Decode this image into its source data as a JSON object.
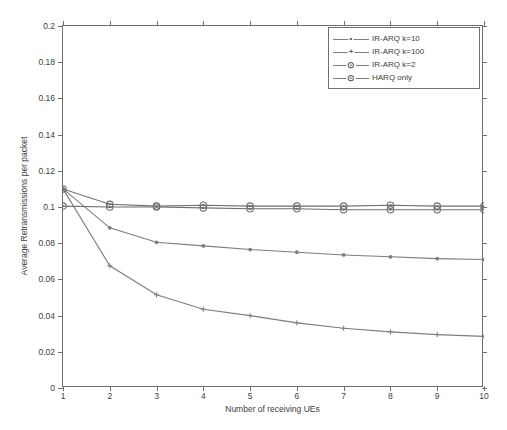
{
  "axes": {
    "xlabel": "Number of receiving UEs",
    "ylabel": "Average Retransmissions per packet",
    "xticks": [
      "1",
      "2",
      "3",
      "4",
      "5",
      "6",
      "7",
      "8",
      "9",
      "10"
    ],
    "yticks": [
      "0",
      "0.02",
      "0.04",
      "0.06",
      "0.08",
      "0.1",
      "0.12",
      "0.14",
      "0.16",
      "0.18",
      "0.2"
    ]
  },
  "legend": {
    "items": [
      {
        "label": "IR-ARQ k=10",
        "marker": "dot-marker"
      },
      {
        "label": "IR-ARQ k=100",
        "marker": "plus-marker"
      },
      {
        "label": "IR-ARQ k=2",
        "marker": "circle-marker"
      },
      {
        "label": "HARQ only",
        "marker": "circle-marker"
      }
    ]
  },
  "chart_data": {
    "type": "line",
    "title": "",
    "xlabel": "Number of receiving UEs",
    "ylabel": "Average Retransmissions per packet",
    "xlim": [
      1,
      10
    ],
    "ylim": [
      0,
      0.2
    ],
    "grid": false,
    "legend_position": "top-right",
    "x": [
      1,
      2,
      3,
      4,
      5,
      6,
      7,
      8,
      9,
      10
    ],
    "series": [
      {
        "name": "IR-ARQ k=10",
        "marker": "dot-marker",
        "color": "#7d7d7d",
        "values": [
          0.11,
          0.0885,
          0.0805,
          0.0785,
          0.0765,
          0.075,
          0.0735,
          0.0725,
          0.0715,
          0.071
        ]
      },
      {
        "name": "IR-ARQ k=100",
        "marker": "plus-marker",
        "color": "#7d7d7d",
        "values": [
          0.11,
          0.0675,
          0.0515,
          0.0435,
          0.04,
          0.036,
          0.033,
          0.031,
          0.0295,
          0.0285
        ]
      },
      {
        "name": "IR-ARQ k=2",
        "marker": "circle-marker",
        "color": "#6f6f6f",
        "values": [
          0.11,
          0.1015,
          0.1005,
          0.101,
          0.1005,
          0.1005,
          0.1005,
          0.101,
          0.1005,
          0.1005
        ]
      },
      {
        "name": "HARQ only",
        "marker": "circle-marker",
        "color": "#6f6f6f",
        "values": [
          0.1005,
          0.1,
          0.1,
          0.0995,
          0.099,
          0.099,
          0.0985,
          0.0985,
          0.0985,
          0.0985
        ]
      }
    ]
  }
}
